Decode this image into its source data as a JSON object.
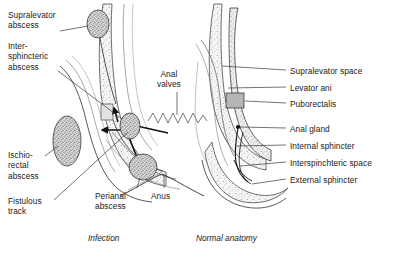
{
  "figure": {
    "title_left": "Infection",
    "title_right": "Normal anatomy"
  },
  "labels_left": [
    {
      "id": "supralevator-abscess",
      "text": "Supralevator\nabscess",
      "x": 8,
      "y": 10
    },
    {
      "id": "intersphincteric-abscess",
      "text": "Inter-\nsphincteric\nabscess",
      "x": 8,
      "y": 41
    },
    {
      "id": "ischiorectal-abscess",
      "text": "Ischio-\nrectal\nabscess",
      "x": 8,
      "y": 150
    },
    {
      "id": "fistulous-track",
      "text": "Fistulous\ntrack",
      "x": 8,
      "y": 196
    }
  ],
  "labels_center": [
    {
      "id": "anal-valves",
      "text": "Anal\nvalves",
      "x": 157,
      "y": 69
    },
    {
      "id": "anus",
      "text": "Anus",
      "x": 155,
      "y": 191
    },
    {
      "id": "perianal-abscess",
      "text": "Perianal\nabscess",
      "x": 95,
      "y": 191
    }
  ],
  "labels_right": [
    {
      "id": "supralevator-space",
      "text": "Supralevator space",
      "x": 290,
      "y": 66
    },
    {
      "id": "levator-ani",
      "text": "Levator ani",
      "x": 290,
      "y": 83
    },
    {
      "id": "puborectalis",
      "text": "Puborectalis",
      "x": 290,
      "y": 99
    },
    {
      "id": "anal-gland",
      "text": "Anal gland",
      "x": 290,
      "y": 124
    },
    {
      "id": "internal-sphincter",
      "text": "Internal sphincter",
      "x": 290,
      "y": 141
    },
    {
      "id": "interspinchteric-space",
      "text": "Interspinchteric space",
      "x": 290,
      "y": 158
    },
    {
      "id": "external-sphincter",
      "text": "External sphincter",
      "x": 290,
      "y": 175
    }
  ],
  "colors": {
    "ink": "#1a1a1a",
    "leader": "#333333",
    "tissue_fill": "#f2f2f2",
    "stipple": "#8c8c8c",
    "abscess_fill": "#a8a8a8",
    "puborectalis_fill": "#b5b5b5",
    "background": "#ffffff"
  },
  "anatomy": {
    "abscesses": [
      {
        "id": "supralevator",
        "cx": 98,
        "cy": 24,
        "rx": 11,
        "ry": 14
      },
      {
        "id": "intersphincteric",
        "cx": 130,
        "cy": 126,
        "rx": 10,
        "ry": 13
      },
      {
        "id": "ischiorectal",
        "cx": 67,
        "cy": 141,
        "rx": 14,
        "ry": 25
      },
      {
        "id": "perianal",
        "cx": 143,
        "cy": 167,
        "rx": 14,
        "ry": 13
      }
    ],
    "anal_valves_zigzag": {
      "x1": 148,
      "x2": 206,
      "y": 121,
      "peaks": 9,
      "amplitude": 8
    }
  }
}
